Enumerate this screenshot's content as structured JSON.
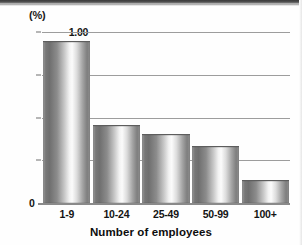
{
  "chart_data": {
    "type": "bar",
    "title": "",
    "subtitle": "",
    "unit_label": "(%)",
    "categories": [
      "1-9",
      "10-24",
      "25-49",
      "50-99",
      "100+"
    ],
    "values": [
      0.94,
      0.45,
      0.4,
      0.33,
      0.13
    ],
    "series": [
      {
        "name": "Proportion",
        "values": [
          0.94,
          0.45,
          0.4,
          0.33,
          0.13
        ]
      }
    ],
    "xlabel": "Number of employees",
    "ylabel": "(%)",
    "ylim": [
      0,
      1.0
    ],
    "yticks": [
      0,
      0.25,
      0.5,
      0.75,
      1.0
    ],
    "ytick_labels": [
      "0",
      "0.25",
      "0.50",
      "0.75",
      "1.00"
    ],
    "grid": true,
    "grid_axis": "y",
    "legend": false,
    "legend_position": "none",
    "bar_style": "cylindrical-gradient",
    "colors": {
      "bar_dark": "#6f6f6f",
      "bar_highlight": "#fbfbfb",
      "gridline": "#9d9d9d",
      "axis": "#8a8a8a",
      "text": "#141414",
      "background": "#ffffff"
    }
  },
  "axis": {
    "unit": "(%)",
    "zero": "0",
    "x_title": "Number of employees"
  }
}
